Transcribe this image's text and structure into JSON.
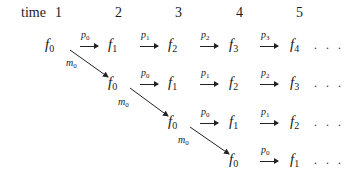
{
  "header": {
    "time_label": "time",
    "times": [
      "1",
      "2",
      "3",
      "4",
      "5"
    ]
  },
  "rows": [
    {
      "nodes": [
        {
          "base": "f",
          "sub": "0"
        },
        {
          "base": "f",
          "sub": "1"
        },
        {
          "base": "f",
          "sub": "2"
        },
        {
          "base": "f",
          "sub": "3"
        },
        {
          "base": "f",
          "sub": "4"
        }
      ],
      "arrows": [
        {
          "base": "p",
          "sub": "0"
        },
        {
          "base": "p",
          "sub": "1"
        },
        {
          "base": "p",
          "sub": "2"
        },
        {
          "base": "p",
          "sub": "3"
        }
      ],
      "ellipsis": ". . ."
    },
    {
      "nodes": [
        {
          "base": "f",
          "sub": "0"
        },
        {
          "base": "f",
          "sub": "1"
        },
        {
          "base": "f",
          "sub": "2"
        },
        {
          "base": "f",
          "sub": "3"
        }
      ],
      "arrows": [
        {
          "base": "p",
          "sub": "0"
        },
        {
          "base": "p",
          "sub": "1"
        },
        {
          "base": "p",
          "sub": "2"
        }
      ],
      "ellipsis": ". . ."
    },
    {
      "nodes": [
        {
          "base": "f",
          "sub": "0"
        },
        {
          "base": "f",
          "sub": "1"
        },
        {
          "base": "f",
          "sub": "2"
        }
      ],
      "arrows": [
        {
          "base": "p",
          "sub": "0"
        },
        {
          "base": "p",
          "sub": "1"
        }
      ],
      "ellipsis": ". . ."
    },
    {
      "nodes": [
        {
          "base": "f",
          "sub": "0"
        },
        {
          "base": "f",
          "sub": "1"
        }
      ],
      "arrows": [
        {
          "base": "p",
          "sub": "0"
        }
      ],
      "ellipsis": ". . ."
    }
  ],
  "diagonal_arrows": [
    {
      "base": "m",
      "sub": "0"
    },
    {
      "base": "m",
      "sub": "0"
    },
    {
      "base": "m",
      "sub": "0"
    }
  ]
}
